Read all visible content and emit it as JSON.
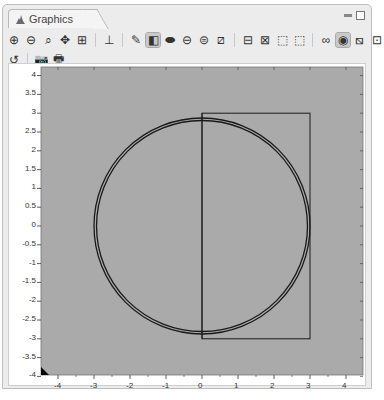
{
  "window": {
    "tab_title": "Graphics",
    "controls": [
      "minimize-icon",
      "maximize-icon"
    ]
  },
  "toolbar": {
    "row1": [
      {
        "name": "zoom-in-icon",
        "glyph": "⊕"
      },
      {
        "name": "zoom-out-icon",
        "glyph": "⊖"
      },
      {
        "name": "zoom-box-icon",
        "glyph": "⌕"
      },
      {
        "name": "zoom-extents-icon",
        "glyph": "✥"
      },
      {
        "name": "zoom-selected-icon",
        "glyph": "⊞"
      },
      {
        "sep": true
      },
      {
        "name": "axis-orientation-icon",
        "glyph": "⊥"
      },
      {
        "sep": true
      },
      {
        "name": "edit-render-icon",
        "glyph": "✎"
      },
      {
        "name": "transparency-icon",
        "glyph": "◧",
        "active": true
      },
      {
        "name": "solid-render-icon",
        "glyph": "⬬"
      },
      {
        "name": "wireframe-icon",
        "glyph": "⊖"
      },
      {
        "name": "wireframe-alt-icon",
        "glyph": "⊜"
      },
      {
        "name": "hide-icon",
        "glyph": "⧄"
      },
      {
        "sep": true
      },
      {
        "name": "select-boundary-icon",
        "glyph": "⊟"
      },
      {
        "name": "select-domain-icon",
        "glyph": "⊠"
      },
      {
        "name": "select-box-icon",
        "glyph": "⬚"
      },
      {
        "name": "deselect-box-icon",
        "glyph": "⬚"
      },
      {
        "sep": true
      },
      {
        "name": "link-icon",
        "glyph": "∞"
      },
      {
        "name": "show-grid-icon",
        "glyph": "◉",
        "active": true
      },
      {
        "name": "show-axis-icon",
        "glyph": "⧅"
      },
      {
        "name": "show-labels-icon",
        "glyph": "⊡"
      }
    ],
    "row2": [
      {
        "name": "reset-view-icon",
        "glyph": "↺"
      },
      {
        "sep": true
      },
      {
        "name": "camera-icon",
        "glyph": "📷"
      },
      {
        "name": "print-icon",
        "glyph": "🖶"
      }
    ]
  },
  "plot": {
    "background": "#aaaaaa",
    "x_ticks": [
      "-4",
      "-3",
      "-2",
      "-1",
      "0",
      "1",
      "2",
      "3",
      "4"
    ],
    "y_ticks": [
      "4",
      "3.5",
      "3",
      "2.5",
      "2",
      "1.5",
      "1",
      "0.5",
      "0",
      "-0.5",
      "-1",
      "-1.5",
      "-2",
      "-2.5",
      "-3",
      "-3.5",
      "-4"
    ],
    "xlim": [
      -4.5,
      4.5
    ],
    "ylim": [
      -4,
      4.3
    ],
    "shapes": [
      {
        "type": "circle",
        "cx": 0,
        "cy": 0,
        "r": 3.0,
        "label": "outer circle"
      },
      {
        "type": "circle",
        "cx": 0,
        "cy": 0,
        "r": 2.93,
        "label": "inner circle"
      },
      {
        "type": "rect",
        "x0": 0,
        "y0": -3,
        "x1": 3,
        "y1": 3,
        "label": "square"
      },
      {
        "type": "line",
        "x0": 0,
        "y0": -3,
        "x1": 0,
        "y1": 3,
        "label": "vertical split"
      }
    ]
  }
}
